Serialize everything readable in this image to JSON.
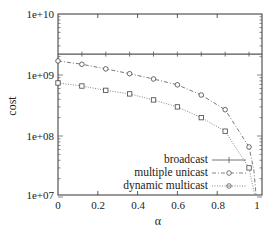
{
  "chart_data": {
    "type": "line",
    "title": "",
    "xlabel": "α",
    "ylabel": "cost",
    "xlim": [
      0,
      1
    ],
    "ylim": [
      10000000.0,
      10000000000.0
    ],
    "yscale": "log",
    "grid": false,
    "legend_position": "lower right",
    "x_ticks": [
      "0",
      "0.2",
      "0.4",
      "0.6",
      "0.8",
      "1"
    ],
    "y_ticks": [
      "1e+07",
      "1e+08",
      "1e+09",
      "1e+10"
    ],
    "x": [
      0,
      0.12,
      0.24,
      0.36,
      0.48,
      0.6,
      0.72,
      0.84,
      0.96
    ],
    "series": [
      {
        "name": "broadcast",
        "marker": "plus",
        "line_style": "solid",
        "values": [
          2200000000.0,
          2200000000.0,
          2200000000.0,
          2200000000.0,
          2200000000.0,
          2200000000.0,
          2200000000.0,
          2200000000.0,
          2200000000.0
        ]
      },
      {
        "name": "multiple unicast",
        "marker": "circle",
        "line_style": "dash-dot",
        "values": [
          1700000000.0,
          1500000000.0,
          1260000000.0,
          1050000000.0,
          860000000.0,
          690000000.0,
          470000000.0,
          270000000.0,
          66000000.0
        ]
      },
      {
        "name": "dynamic multicast",
        "marker": "square",
        "line_style": "dotted",
        "values": [
          740000000.0,
          660000000.0,
          560000000.0,
          490000000.0,
          390000000.0,
          300000000.0,
          200000000.0,
          120000000.0,
          30000000.0
        ]
      }
    ]
  },
  "axes": {
    "xlabel": "α",
    "ylabel": "cost",
    "x_ticks": [
      "0",
      "0.2",
      "0.4",
      "0.6",
      "0.8",
      "1"
    ],
    "y_ticks": [
      "1e+10",
      "1e+09",
      "1e+08",
      "1e+07"
    ]
  },
  "legend": {
    "items": [
      "broadcast",
      "multiple unicast",
      "dynamic multicast"
    ]
  }
}
